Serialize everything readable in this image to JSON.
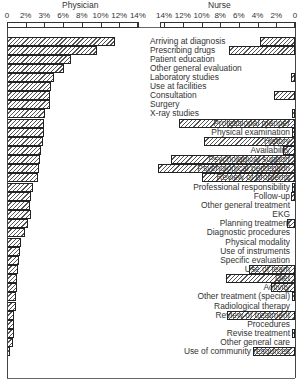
{
  "chart_data": {
    "type": "bar",
    "orientation": "horizontal",
    "layout": "back-to-back (butterfly)",
    "titles": {
      "left": "Physician",
      "right": "Nurse"
    },
    "left_axis_ticks": [
      "0",
      "2%",
      "3%",
      "6%",
      "8%",
      "10%",
      "12%",
      "14%"
    ],
    "right_axis_ticks": [
      "14%",
      "12%",
      "10%",
      "8%",
      "6%",
      "4%",
      "2%",
      "0"
    ],
    "xlim": [
      0,
      14
    ],
    "grid": false,
    "legend": "none",
    "categories": [
      "Arriving at diagnosis",
      "Prescribing drugs",
      "Patient education",
      "Other general evaluation",
      "Laboratory studies",
      "Use at facilities",
      "Consultation",
      "Surgery",
      "X-ray studies",
      "Professional manner",
      "Physical examination",
      "History",
      "Availability",
      "Psychological support",
      "Psychological perception",
      "Review of problems",
      "Professional responsibility",
      "Follow-up",
      "Other general treatment",
      "EKG",
      "Planning treatment",
      "Diagnostic procedures",
      "Physical modality",
      "Use of instruments",
      "Specific evaluation",
      "Use of team",
      "Diet",
      "Activity",
      "Other treatment (special)",
      "Radiological therapy",
      "Review of treatment",
      "Procedures",
      "Revise treatment",
      "Other general care",
      "Use of community resources"
    ],
    "series": [
      {
        "name": "Physician",
        "unit": "%",
        "values": [
          11.5,
          9.6,
          6.8,
          6.1,
          5.0,
          4.7,
          4.6,
          4.6,
          4.1,
          4.0,
          4.0,
          3.9,
          3.6,
          3.5,
          3.4,
          3.3,
          2.8,
          2.6,
          2.5,
          2.6,
          2.2,
          1.9,
          1.5,
          1.4,
          1.3,
          1.2,
          1.1,
          1.1,
          1.0,
          1.0,
          0.8,
          0.8,
          0.7,
          0.6,
          0.3
        ]
      },
      {
        "name": "Nurse",
        "unit": "%",
        "values": [
          3.7,
          7.1,
          0,
          0,
          0.4,
          0,
          2.2,
          0,
          0.3,
          12.4,
          0.2,
          9.7,
          1.3,
          13.3,
          14.6,
          9.9,
          0.2,
          0.4,
          0,
          0,
          0.9,
          0,
          0,
          0,
          0,
          4.9,
          7.4,
          2.6,
          0.3,
          0,
          7.3,
          0,
          0.3,
          0,
          4.5
        ]
      }
    ]
  },
  "row_tops": [
    37,
    46,
    55,
    64,
    73,
    82,
    91,
    100,
    109,
    119,
    128,
    137,
    146,
    155,
    164,
    173,
    183,
    192,
    201,
    210,
    219,
    228,
    238,
    247,
    256,
    265,
    274,
    283,
    292,
    302,
    311,
    320,
    329,
    338,
    347
  ]
}
